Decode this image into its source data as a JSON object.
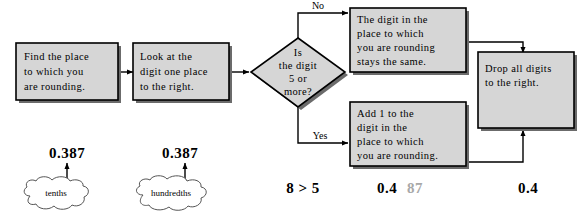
{
  "diagram": {
    "colors": {
      "box_fill": "#d6d6d6",
      "box_stroke": "#000000",
      "shadow": "#6b6b6b",
      "faded_digit": "#a8a8a8",
      "background": "#ffffff"
    },
    "steps": [
      {
        "id": "find-place",
        "lines": [
          "Find the place",
          "to which you",
          "are rounding."
        ]
      },
      {
        "id": "look-digit",
        "lines": [
          "Look at the",
          "digit one place",
          "to the right."
        ]
      },
      {
        "id": "stays-same",
        "lines": [
          "The digit in the",
          "place to which",
          "you are rounding",
          "stays the same."
        ]
      },
      {
        "id": "add-one",
        "lines": [
          "Add 1 to the",
          "digit in the",
          "place to which",
          "you are rounding."
        ]
      },
      {
        "id": "drop-digits",
        "lines": [
          "Drop all digits",
          "to the right."
        ]
      }
    ],
    "decision": {
      "id": "is-digit-5-or-more",
      "lines": [
        "Is",
        "the digit",
        "5 or",
        "more?"
      ]
    },
    "branches": {
      "no_label": "No",
      "yes_label": "Yes"
    },
    "callouts": [
      {
        "id": "tenths",
        "number": "0.387",
        "label": "tenths"
      },
      {
        "id": "hundredths",
        "number": "0.387",
        "label": "hundredths"
      }
    ],
    "annotations": [
      {
        "id": "comparison",
        "text": "8 > 5"
      },
      {
        "id": "rounded-with-dropped",
        "kept": "0.4",
        "dropped": "87"
      },
      {
        "id": "final-answer",
        "text": "0.4"
      }
    ]
  }
}
